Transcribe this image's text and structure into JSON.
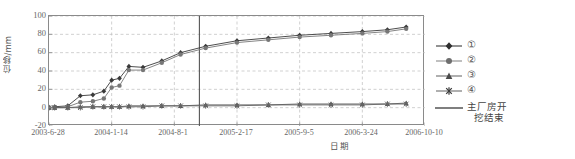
{
  "chart_data": {
    "type": "line",
    "title": "",
    "xlabel": "日期",
    "ylabel": "位移/mm",
    "ylim": [
      -20,
      100
    ],
    "yticks": [
      100,
      80,
      60,
      40,
      20,
      0,
      -20
    ],
    "grid": "horizontal-and-vertical-dashed",
    "legend_position": "right",
    "xticks": [
      "2003-6-28",
      "2004-1-14",
      "2004-8-1",
      "2005-2-17",
      "2005-9-5",
      "2006-3-24",
      "2006-10-10"
    ],
    "x_unit": "days-since-2003-6-28",
    "x_tick_days": [
      0,
      200,
      400,
      600,
      800,
      1000,
      1200
    ],
    "annotations": [
      {
        "name": "main-powerhouse-excavation-end",
        "label": "主厂房开挖结束",
        "type": "vertical-line",
        "x_days": 480,
        "x_date": "2004-10-20"
      }
    ],
    "series": [
      {
        "name": "①",
        "marker": "filled-diamond",
        "x": [
          0,
          18,
          60,
          100,
          140,
          175,
          200,
          225,
          255,
          300,
          360,
          420,
          500,
          600,
          700,
          800,
          900,
          1000,
          1080,
          1140
        ],
        "values": [
          0,
          1,
          2,
          13,
          14,
          18,
          30,
          32,
          45,
          44,
          51,
          60,
          67,
          73,
          76,
          79,
          81,
          83,
          85,
          88
        ]
      },
      {
        "name": "②",
        "marker": "filled-circle",
        "x": [
          0,
          18,
          60,
          100,
          140,
          175,
          200,
          225,
          255,
          300,
          360,
          420,
          500,
          600,
          700,
          800,
          900,
          1000,
          1080,
          1140
        ],
        "values": [
          0,
          0,
          1,
          6,
          7,
          10,
          22,
          24,
          41,
          41,
          49,
          58,
          65,
          71,
          74,
          77,
          79,
          81,
          83,
          86
        ]
      },
      {
        "name": "③",
        "marker": "filled-triangle",
        "x": [
          0,
          18,
          60,
          100,
          140,
          175,
          200,
          225,
          255,
          300,
          360,
          420,
          500,
          600,
          700,
          800,
          900,
          1000,
          1080,
          1140
        ],
        "values": [
          0,
          0,
          0,
          1,
          1,
          1,
          1,
          1,
          2,
          2,
          2,
          2,
          3,
          3,
          3,
          4,
          4,
          4,
          4,
          5
        ]
      },
      {
        "name": "④",
        "marker": "star-cross",
        "x": [
          0,
          18,
          60,
          100,
          140,
          175,
          200,
          225,
          255,
          300,
          360,
          420,
          500,
          600,
          700,
          800,
          900,
          1000,
          1080,
          1140
        ],
        "values": [
          0,
          0,
          0,
          0,
          1,
          1,
          1,
          1,
          1,
          1,
          2,
          2,
          2,
          2,
          3,
          3,
          3,
          3,
          4,
          4
        ]
      }
    ],
    "colors": {
      "series1": "#3a3a3a",
      "series2": "#777777",
      "series3": "#555555",
      "series4": "#666666",
      "grid": "#bdbdbd",
      "axis": "#8a8a8a",
      "reference_line": "#555555"
    }
  },
  "legend": {
    "items": [
      {
        "label": "①",
        "marker": "filled-diamond"
      },
      {
        "label": "②",
        "marker": "filled-circle"
      },
      {
        "label": "③",
        "marker": "filled-triangle"
      },
      {
        "label": "④",
        "marker": "star-cross"
      }
    ],
    "reference": {
      "line1": "主厂房开",
      "line2": "挖结束"
    }
  }
}
